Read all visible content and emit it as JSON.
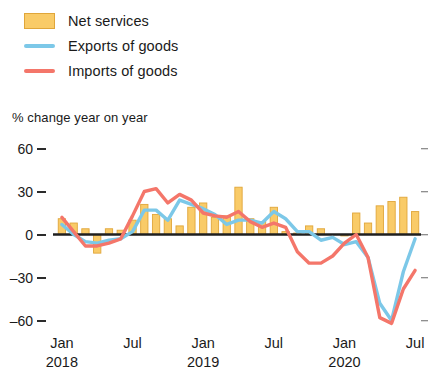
{
  "legend": {
    "items": [
      {
        "label": "Net services",
        "marker": "bar-swatch",
        "color": "#F9CB68"
      },
      {
        "label": "Exports of goods",
        "marker": "line-swatch",
        "color": "#7CC8E8"
      },
      {
        "label": "Imports of goods",
        "marker": "line-swatch",
        "color": "#F4766A"
      }
    ]
  },
  "axis_title": "% change year on year",
  "chart_data": {
    "type": "bar",
    "title": "",
    "subtitle": "",
    "xlabel": "",
    "ylabel": "% change year on year",
    "ylim": [
      -70,
      68
    ],
    "yticks": [
      60,
      30,
      0,
      -30,
      -60
    ],
    "ytick_labels": [
      "60",
      "30",
      "0",
      "–30",
      "–60"
    ],
    "grid": false,
    "legend_position": "top-left",
    "x": [
      "Jan 2018",
      "Feb 2018",
      "Mar 2018",
      "Apr 2018",
      "May 2018",
      "Jun 2018",
      "Jul 2018",
      "Aug 2018",
      "Sep 2018",
      "Oct 2018",
      "Nov 2018",
      "Dec 2018",
      "Jan 2019",
      "Feb 2019",
      "Mar 2019",
      "Apr 2019",
      "May 2019",
      "Jun 2019",
      "Jul 2019",
      "Aug 2019",
      "Sep 2019",
      "Oct 2019",
      "Nov 2019",
      "Dec 2019",
      "Jan 2020",
      "Feb 2020",
      "Mar 2020",
      "Apr 2020",
      "May 2020",
      "Jun 2020",
      "Jul 2020"
    ],
    "xtick_labels": [
      {
        "month": "Jan",
        "year": "2018",
        "index": 0
      },
      {
        "month": "Jul",
        "year": "",
        "index": 6
      },
      {
        "month": "Jan",
        "year": "2019",
        "index": 12
      },
      {
        "month": "Jul",
        "year": "",
        "index": 18
      },
      {
        "month": "Jan",
        "year": "2020",
        "index": 24
      },
      {
        "month": "Jul",
        "year": "",
        "index": 30
      }
    ],
    "series": [
      {
        "name": "Net services",
        "type": "bar",
        "color": "#F9CB68",
        "edge_color": "#E0A63A",
        "values": [
          11,
          8,
          4,
          -13,
          4,
          3,
          10,
          21,
          14,
          11,
          6,
          19,
          22,
          12,
          13,
          33,
          11,
          9,
          19,
          2,
          1,
          6,
          4,
          0,
          -1,
          15,
          8,
          20,
          23,
          26,
          16
        ]
      },
      {
        "name": "Exports of goods",
        "type": "line",
        "color": "#7CC8E8",
        "values": [
          7,
          0,
          -5,
          -6,
          -4,
          -3,
          2,
          17,
          17,
          10,
          24,
          21,
          18,
          14,
          7,
          10,
          10,
          8,
          16,
          11,
          2,
          2,
          -4,
          -2,
          -7,
          -5,
          -16,
          -48,
          -60,
          -26,
          -3
        ]
      },
      {
        "name": "Imports of goods",
        "type": "line",
        "color": "#F4766A",
        "values": [
          12,
          2,
          -8,
          -8,
          -6,
          -3,
          13,
          30,
          32,
          22,
          28,
          24,
          15,
          13,
          12,
          16,
          9,
          5,
          8,
          5,
          -12,
          -20,
          -20,
          -15,
          -6,
          0,
          -16,
          -58,
          -62,
          -38,
          -25
        ]
      }
    ]
  }
}
